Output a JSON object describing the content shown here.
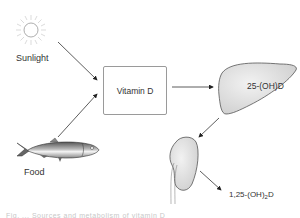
{
  "diagram": {
    "sources": [
      {
        "id": "sunlight",
        "label": "Sunlight",
        "icon": "sun-icon"
      },
      {
        "id": "food",
        "label": "Food",
        "icon": "fish-icon"
      }
    ],
    "central_node": {
      "label": "Vitamin D"
    },
    "liver": {
      "label": "25-(OH)D",
      "icon": "liver-icon"
    },
    "kidney": {
      "icon": "kidney-icon"
    },
    "product": {
      "label_main": "1,25-(OH)",
      "label_sub": "2",
      "label_tail": "D"
    },
    "caption": "Fig. ... Sources and metabolism of vitamin D"
  },
  "colors": {
    "organ_fill": "#dcdcdc",
    "stroke": "#555555",
    "text": "#333333"
  }
}
